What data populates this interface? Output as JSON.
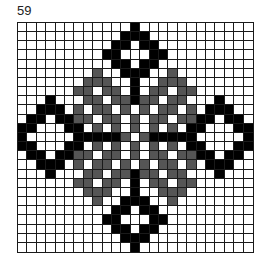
{
  "page": {
    "number": "59"
  },
  "chart": {
    "columns": 25,
    "rows": 25,
    "colors": {
      "white": "#ffffff",
      "black": "#000000",
      "gray": "#555555",
      "gridline": "#1a1a1a"
    },
    "legend": {
      "W": "empty",
      "K": "black stitch",
      "G": "gray stitch"
    },
    "pattern": [
      "WWWWWWWWWWWWKWWWWWWWWWWWW",
      "WWWWWWWWWWWKKKWWWWWWWWWWW",
      "WWWWWWWWWWKKWKKWWWWWWWWWW",
      "WWWWWWWWWKKWWWKKWWWWWWWWW",
      "WWWWWWWWWWKKWKKWWWWWWWWWW",
      "WWWWWWWWGWWKKKWWGWWWWWWWW",
      "WWWWWWWGGGWWKWWGGGWWWWWWW",
      "WWWWWWGGWGGWKWGGWGGWWWWWW",
      "WWWKWWWGGWGGKGGWGGWWWKWWW",
      "WWKKKWGWGGWGWGWGGWGWKKKWW",
      "WKKWKKGGWGGWGWGGWGGKKWKKW",
      "KKWWWKKWGWGWGWGWGWKKWWWKK",
      "KWWWWWKKKKKGWGKKKKKWWWWWK",
      "KKWWWKKWGWGWGWGWGWKKWWWKK",
      "WKKWKKGGWGGWGWGGWGGKKWKKW",
      "WWKKKWGWGGWGWGWGGWGWKKKWW",
      "WWWKWWWGGWGGKGGWGGWWWKWWW",
      "WWWWWWGGWGGWKWGGWGGWWWWWW",
      "WWWWWWWGGGWWKWWGGGWWWWWWW",
      "WWWWWWWWGWWKKKWWGWWWWWWWW",
      "WWWWWWWWWWKKWKKWWWWWWWWWW",
      "WWWWWWWWWKKWWWKKWWWWWWWWW",
      "WWWWWWWWWWKKWKKWWWWWWWWWW",
      "WWWWWWWWWWWKKKWWWWWWWWWWW",
      "WWWWWWWWWWWWKWWWWWWWWWWWW"
    ]
  }
}
